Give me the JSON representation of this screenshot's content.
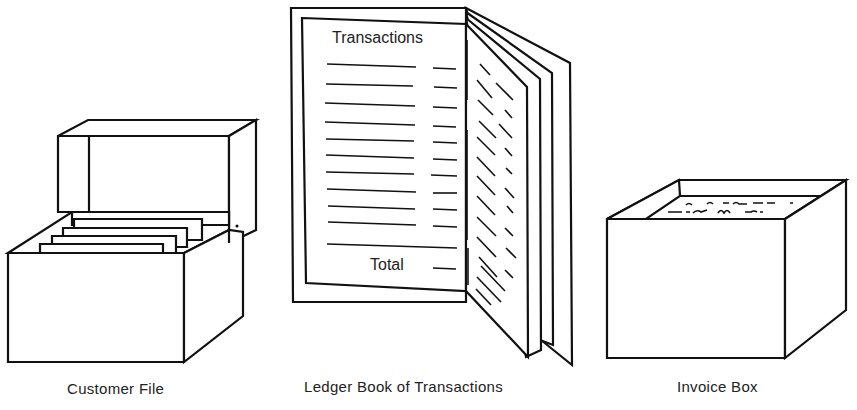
{
  "figure": {
    "items": [
      {
        "id": "customer-file",
        "label": "Customer File"
      },
      {
        "id": "ledger-book",
        "label": "Ledger Book of Transactions",
        "page_heading": "Transactions",
        "page_footer": "Total",
        "line_count": 11
      },
      {
        "id": "invoice-box",
        "label": "Invoice Box"
      }
    ],
    "colors": {
      "ink": "#111111",
      "background": "#ffffff"
    }
  }
}
